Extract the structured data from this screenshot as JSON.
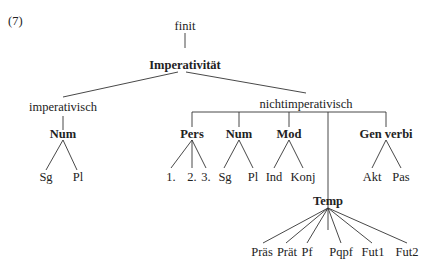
{
  "example_number": "(7)",
  "nodes": {
    "finit": "finit",
    "imperativitaet": "Imperativität",
    "imperativisch": "imperativisch",
    "nichtimperativisch": "nichtimperativisch",
    "imp_num": "Num",
    "imp_sg": "Sg",
    "imp_pl": "Pl",
    "pers": "Pers",
    "pers_1": "1.",
    "pers_2": "2.",
    "pers_3": "3.",
    "num": "Num",
    "num_sg": "Sg",
    "num_pl": "Pl",
    "mod": "Mod",
    "mod_ind": "Ind",
    "mod_konj": "Konj",
    "gen_verbi": "Gen verbi",
    "gv_akt": "Akt",
    "gv_pas": "Pas",
    "temp": "Temp",
    "temp_praes": "Präs",
    "temp_praet": "Prät",
    "temp_pf": "Pf",
    "temp_pqpf": "Pqpf",
    "temp_fut1": "Fut1",
    "temp_fut2": "Fut2"
  }
}
